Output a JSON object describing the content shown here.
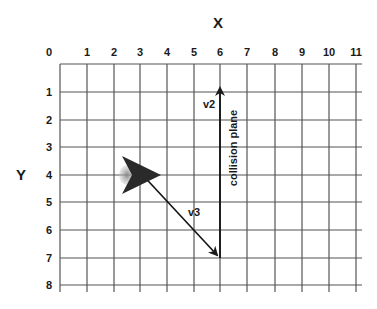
{
  "diagram": {
    "x_axis": {
      "title": "X",
      "ticks": [
        "0",
        "1",
        "2",
        "3",
        "4",
        "5",
        "6",
        "7",
        "8",
        "9",
        "10",
        "11"
      ]
    },
    "y_axis": {
      "title": "Y",
      "ticks": [
        "1",
        "2",
        "3",
        "4",
        "5",
        "6",
        "7",
        "8"
      ]
    },
    "vectors": [
      {
        "label": "v2",
        "from": [
          6,
          7
        ],
        "to": [
          6,
          1
        ]
      },
      {
        "label": "v3",
        "from": [
          3,
          4
        ],
        "to": [
          6,
          7
        ]
      }
    ],
    "annotations": {
      "collision_plane": "collision plane"
    },
    "ship": {
      "position": [
        3,
        4
      ],
      "heading": "right"
    },
    "colors": {
      "grid": "#555555",
      "ink": "#1a1a1a",
      "ship": "#2a2a2a",
      "ship_glow": "#777777"
    }
  }
}
